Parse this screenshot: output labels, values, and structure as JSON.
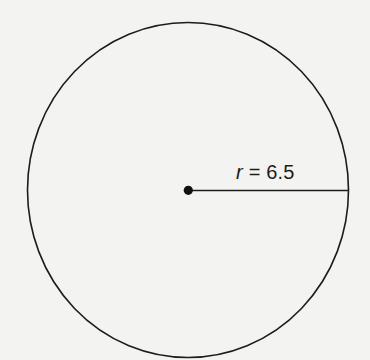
{
  "diagram": {
    "type": "circle-radius",
    "shape": "circle",
    "center_point": "dot",
    "radius_label": {
      "variable": "r",
      "equals": " = ",
      "value": "6.5"
    },
    "colors": {
      "background": "#f3f3f1",
      "stroke": "#1c1c1c"
    }
  }
}
